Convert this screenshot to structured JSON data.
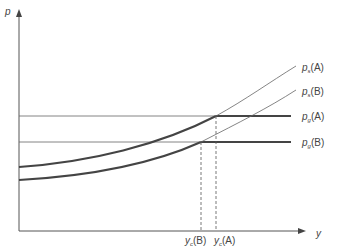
{
  "axes": {
    "y_label": "p",
    "x_label": "y"
  },
  "curves": [
    {
      "id": "ps-A",
      "symbol": "p",
      "subscript": "s",
      "suffix": "(A)"
    },
    {
      "id": "ps-B",
      "symbol": "p",
      "subscript": "s",
      "suffix": "(B)"
    }
  ],
  "levels": [
    {
      "id": "pg-A",
      "symbol": "p",
      "subscript": "g",
      "suffix": "(A)"
    },
    {
      "id": "pg-B",
      "symbol": "p",
      "subscript": "g",
      "suffix": "(B)"
    }
  ],
  "x_markers": [
    {
      "id": "yc-B",
      "symbol": "y",
      "subscript": "c",
      "suffix": "(B)"
    },
    {
      "id": "yc-A",
      "symbol": "y",
      "subscript": "c",
      "suffix": "(A)"
    }
  ],
  "colors": {
    "axis": "#555555",
    "thick": "#444444",
    "thin": "#666666"
  }
}
